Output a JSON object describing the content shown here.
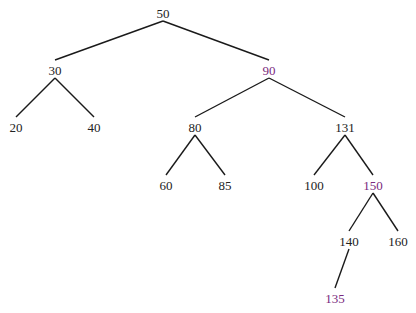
{
  "colors": {
    "normal": "#222222",
    "highlight": "#7a2a7e",
    "edge": "#1a1a1a",
    "background": "#ffffff"
  },
  "tree": {
    "type": "binary-search-tree",
    "nodes": [
      {
        "id": "n50",
        "label": "50",
        "x": 163,
        "y": 15,
        "highlight": false
      },
      {
        "id": "n30",
        "label": "30",
        "x": 55,
        "y": 72,
        "highlight": false
      },
      {
        "id": "n90",
        "label": "90",
        "x": 269,
        "y": 72,
        "highlight": true
      },
      {
        "id": "n20",
        "label": "20",
        "x": 16,
        "y": 129,
        "highlight": false
      },
      {
        "id": "n40",
        "label": "40",
        "x": 94,
        "y": 129,
        "highlight": false
      },
      {
        "id": "n80",
        "label": "80",
        "x": 195,
        "y": 129,
        "highlight": false
      },
      {
        "id": "n131",
        "label": "131",
        "x": 345,
        "y": 129,
        "highlight": false
      },
      {
        "id": "n60",
        "label": "60",
        "x": 166,
        "y": 187,
        "highlight": false
      },
      {
        "id": "n85",
        "label": "85",
        "x": 225,
        "y": 187,
        "highlight": false
      },
      {
        "id": "n100",
        "label": "100",
        "x": 314,
        "y": 187,
        "highlight": false
      },
      {
        "id": "n150",
        "label": "150",
        "x": 373,
        "y": 187,
        "highlight": true
      },
      {
        "id": "n140",
        "label": "140",
        "x": 349,
        "y": 243,
        "highlight": false
      },
      {
        "id": "n160",
        "label": "160",
        "x": 398,
        "y": 243,
        "highlight": false
      },
      {
        "id": "n135",
        "label": "135",
        "x": 335,
        "y": 300,
        "highlight": true
      }
    ],
    "edges": [
      {
        "from": "n50",
        "to": "n30"
      },
      {
        "from": "n50",
        "to": "n90"
      },
      {
        "from": "n30",
        "to": "n20"
      },
      {
        "from": "n30",
        "to": "n40"
      },
      {
        "from": "n90",
        "to": "n80"
      },
      {
        "from": "n90",
        "to": "n131"
      },
      {
        "from": "n80",
        "to": "n60"
      },
      {
        "from": "n80",
        "to": "n85"
      },
      {
        "from": "n131",
        "to": "n100"
      },
      {
        "from": "n131",
        "to": "n150"
      },
      {
        "from": "n150",
        "to": "n140"
      },
      {
        "from": "n150",
        "to": "n160"
      },
      {
        "from": "n140",
        "to": "n135"
      }
    ]
  }
}
